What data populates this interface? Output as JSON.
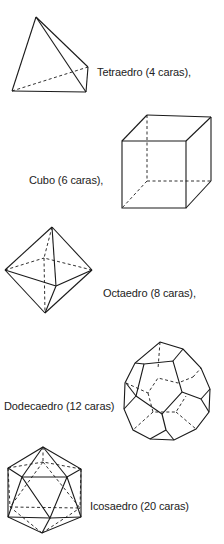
{
  "solids": [
    {
      "name": "tetrahedron",
      "label": "Tetraedro (4 caras),"
    },
    {
      "name": "cube",
      "label": "Cubo (6 caras),"
    },
    {
      "name": "octahedron",
      "label": "Octaedro (8 caras),"
    },
    {
      "name": "dodecahedron",
      "label": "Dodecaedro (12 caras)"
    },
    {
      "name": "icosahedron",
      "label": "Icosaedro (20 caras)"
    }
  ]
}
